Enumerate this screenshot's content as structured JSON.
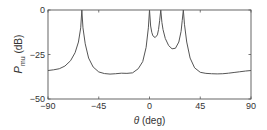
{
  "chart_data": {
    "type": "line",
    "title": "",
    "xlabel": "θ (deg)",
    "xlabel_symbol": "θ",
    "xlabel_unit": " (deg)",
    "ylabel": "P_mu (dB)",
    "ylabel_symbol": "P",
    "ylabel_subscript": "mu",
    "ylabel_unit": " (dB)",
    "xlim": [
      -90,
      90
    ],
    "ylim": [
      -50,
      0
    ],
    "xticks": [
      -90,
      -45,
      0,
      45,
      90
    ],
    "xtick_labels": [
      "−90",
      "−45",
      "0",
      "45",
      "90"
    ],
    "yticks": [
      0,
      -25,
      -50
    ],
    "ytick_labels": [
      "0",
      "−25",
      "−50"
    ],
    "grid": false,
    "legend": null,
    "line_color": "#555555",
    "peaks_deg": [
      -60,
      0,
      10,
      30
    ],
    "series": [
      {
        "name": "MUSIC pseudospectrum",
        "x": [
          -90,
          -85,
          -80,
          -75,
          -70,
          -66,
          -63,
          -61,
          -60,
          -59,
          -57,
          -54,
          -50,
          -45,
          -40,
          -35,
          -30,
          -25,
          -20,
          -15,
          -10,
          -6,
          -3,
          -1,
          0,
          1,
          2,
          3,
          5,
          7,
          8,
          9,
          10,
          11,
          12,
          14,
          17,
          20,
          23,
          26,
          28,
          29,
          30,
          31,
          33,
          36,
          40,
          45,
          50,
          55,
          60,
          65,
          70,
          75,
          80,
          85,
          90
        ],
        "values": [
          -34,
          -33.6,
          -33,
          -31.5,
          -28.5,
          -24,
          -18,
          -10,
          0,
          -10,
          -19,
          -27,
          -32,
          -34.8,
          -35.7,
          -36,
          -35.8,
          -35.5,
          -35.6,
          -35.3,
          -33,
          -29,
          -21,
          -10,
          0,
          -9,
          -12.5,
          -14.5,
          -15.5,
          -14,
          -11,
          -6,
          0,
          -7,
          -11,
          -16,
          -20,
          -21.8,
          -21.5,
          -18,
          -12,
          -6,
          0,
          -8,
          -18,
          -27,
          -32.5,
          -35,
          -35.6,
          -35.8,
          -35.9,
          -35.8,
          -35.5,
          -35.1,
          -34.7,
          -34.3,
          -34
        ]
      }
    ]
  }
}
